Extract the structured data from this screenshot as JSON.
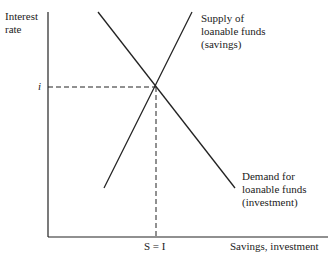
{
  "diagram": {
    "type": "loanable-funds-market",
    "y_axis_label_line1": "Interest",
    "y_axis_label_line2": "rate",
    "x_axis_label": "Savings, investment",
    "equilibrium_rate_label": "i",
    "equilibrium_quantity_label": "S = I",
    "supply_label_line1": "Supply of",
    "supply_label_line2": "loanable funds",
    "supply_label_line3": "(savings)",
    "demand_label_line1": "Demand for",
    "demand_label_line2": "loanable funds",
    "demand_label_line3": "(investment)",
    "colors": {
      "line": "#222222",
      "background": "#ffffff"
    }
  }
}
